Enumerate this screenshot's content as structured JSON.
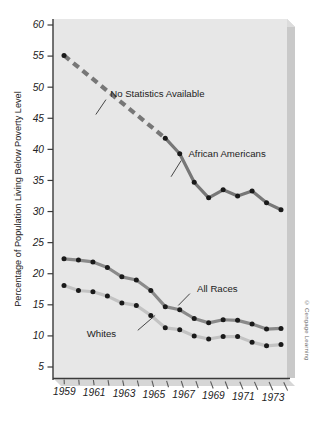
{
  "chart_data": {
    "type": "line",
    "title": "",
    "xlabel": "",
    "ylabel": "Percentage of Population Living Below Poverty Level",
    "xlim": [
      1959,
      1974
    ],
    "ylim": [
      0,
      60
    ],
    "yticks": [
      60,
      55,
      50,
      45,
      40,
      35,
      30,
      25,
      20,
      15,
      10,
      5
    ],
    "ytick_labels": [
      "60",
      "55",
      "50",
      "45",
      "40",
      "35",
      "30",
      "25",
      "20",
      "15",
      "10",
      "5"
    ],
    "xticks": [
      1959,
      1960,
      1961,
      1962,
      1963,
      1964,
      1965,
      1966,
      1967,
      1968,
      1969,
      1970,
      1971,
      1972,
      1973,
      1974
    ],
    "xtick_labels": [
      "1959",
      "",
      "1961",
      "",
      "1963",
      "",
      "1965",
      "",
      "1967",
      "",
      "1969",
      "",
      "1971",
      "",
      "1973",
      ""
    ],
    "grid": false,
    "legend_position": "inline-annotations",
    "x": [
      1959,
      1960,
      1961,
      1962,
      1963,
      1964,
      1965,
      1966,
      1967,
      1968,
      1969,
      1970,
      1971,
      1972,
      1973,
      1974
    ],
    "series": [
      {
        "name": "African Americans",
        "color": "#777777",
        "label_x": 1967.6,
        "label_y": 39.3,
        "leader_from_x": 1967.1,
        "leader_from_y": 38.2,
        "leader_to_x": 1966.4,
        "leader_to_y": 35.6,
        "dashed_upto_year": 1965,
        "values": [
          55.1,
          null,
          null,
          null,
          null,
          null,
          null,
          41.8,
          39.3,
          33.5,
          31.0,
          32.2,
          31.2,
          32.5,
          30.5,
          30.0
        ],
        "interpolated_dashed": [
          {
            "year": 1959,
            "value": 55.1
          },
          {
            "year": 1966,
            "value": 41.8
          }
        ],
        "markers": [
          {
            "year": 1959,
            "value": 55.1
          },
          {
            "year": 1966,
            "value": 41.8
          },
          {
            "year": 1967,
            "value": 39.3
          },
          {
            "year": 1968,
            "value": 34.7
          },
          {
            "year": 1969,
            "value": 32.2
          },
          {
            "year": 1970,
            "value": 33.5
          },
          {
            "year": 1971,
            "value": 32.5
          },
          {
            "year": 1972,
            "value": 33.3
          },
          {
            "year": 1973,
            "value": 31.4
          },
          {
            "year": 1974,
            "value": 30.3
          }
        ]
      },
      {
        "name": "All Races",
        "color": "#8a8a8a",
        "label_x": 1968.2,
        "label_y": 17.6,
        "leader_from_x": 1967.7,
        "leader_from_y": 16.8,
        "leader_to_x": 1966.9,
        "leader_to_y": 14.9,
        "values": [
          22.4,
          22.2,
          21.9,
          21.0,
          19.5,
          19.0,
          17.3,
          14.7,
          14.2,
          12.8,
          12.1,
          12.6,
          12.5,
          11.9,
          11.1,
          11.2
        ],
        "markers": [
          {
            "year": 1959,
            "value": 22.4
          },
          {
            "year": 1960,
            "value": 22.2
          },
          {
            "year": 1961,
            "value": 21.9
          },
          {
            "year": 1962,
            "value": 21.0
          },
          {
            "year": 1963,
            "value": 19.5
          },
          {
            "year": 1964,
            "value": 19.0
          },
          {
            "year": 1965,
            "value": 17.3
          },
          {
            "year": 1966,
            "value": 14.7
          },
          {
            "year": 1967,
            "value": 14.2
          },
          {
            "year": 1968,
            "value": 12.8
          },
          {
            "year": 1969,
            "value": 12.1
          },
          {
            "year": 1970,
            "value": 12.6
          },
          {
            "year": 1971,
            "value": 12.5
          },
          {
            "year": 1972,
            "value": 11.9
          },
          {
            "year": 1973,
            "value": 11.1
          },
          {
            "year": 1974,
            "value": 11.2
          }
        ]
      },
      {
        "name": "Whites",
        "color": "#c3c3c3",
        "label_x": 1962.6,
        "label_y": 10.4,
        "leader_from_x": 1964.1,
        "leader_from_y": 10.9,
        "leader_to_x": 1965.3,
        "leader_to_y": 13.3,
        "values": [
          18.1,
          17.3,
          17.1,
          16.4,
          15.3,
          14.9,
          13.3,
          11.3,
          11.0,
          10.0,
          9.5,
          9.9,
          9.9,
          9.0,
          8.4,
          8.6
        ],
        "markers": [
          {
            "year": 1959,
            "value": 18.1
          },
          {
            "year": 1960,
            "value": 17.3
          },
          {
            "year": 1961,
            "value": 17.1
          },
          {
            "year": 1962,
            "value": 16.4
          },
          {
            "year": 1963,
            "value": 15.3
          },
          {
            "year": 1964,
            "value": 14.9
          },
          {
            "year": 1965,
            "value": 13.3
          },
          {
            "year": 1966,
            "value": 11.3
          },
          {
            "year": 1967,
            "value": 11.0
          },
          {
            "year": 1968,
            "value": 10.0
          },
          {
            "year": 1969,
            "value": 9.5
          },
          {
            "year": 1970,
            "value": 9.9
          },
          {
            "year": 1971,
            "value": 9.9
          },
          {
            "year": 1972,
            "value": 9.0
          },
          {
            "year": 1973,
            "value": 8.4
          },
          {
            "year": 1974,
            "value": 8.6
          }
        ]
      }
    ],
    "annotations": [
      {
        "name": "no-statistics-available",
        "text": "No Statistics Available",
        "x": 1962.2,
        "y": 49.0,
        "leader_from_x": 1961.9,
        "leader_from_y": 48.0,
        "leader_to_x": 1961.2,
        "leader_to_y": 45.6
      }
    ],
    "colors": {
      "panel": "#e6e6e6",
      "panel_edge": "#bdbdbd",
      "panel_shadow": "#c8c8c8",
      "axis": "#3a3a3a",
      "marker": "#1a1a1a",
      "text": "#222222"
    }
  },
  "footer": {
    "copyright": "© Cengage Learning"
  }
}
